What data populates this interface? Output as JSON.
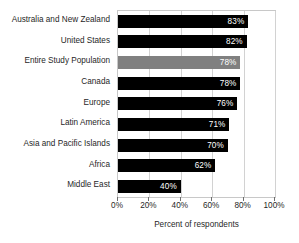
{
  "chart_data": {
    "type": "bar",
    "orientation": "horizontal",
    "title": "",
    "xlabel": "Percent of respondents",
    "ylabel": "",
    "xlim": [
      0,
      100
    ],
    "grid": true,
    "legend": "none",
    "xticks": [
      "0%",
      "20%",
      "40%",
      "60%",
      "80%",
      "100%"
    ],
    "xtick_values": [
      0,
      20,
      40,
      60,
      80,
      100
    ],
    "categories": [
      "Australia and New Zealand",
      "United States",
      "Entire Study Population",
      "Canada",
      "Europe",
      "Latin America",
      "Asia and Pacific Islands",
      "Africa",
      "Middle East"
    ],
    "values": [
      83,
      82,
      78,
      78,
      76,
      71,
      70,
      62,
      40
    ],
    "value_labels": [
      "83%",
      "82%",
      "78%",
      "78%",
      "76%",
      "71%",
      "70%",
      "62%",
      "40%"
    ],
    "bar_colors": [
      "#000000",
      "#000000",
      "#808080",
      "#000000",
      "#000000",
      "#000000",
      "#000000",
      "#000000",
      "#000000"
    ],
    "highlight_category": "Entire Study Population",
    "highlight_color": "#808080",
    "bar_color": "#000000",
    "value_label_color": "#ffffff",
    "axis_color": "#c8c8c8",
    "grid_color": "#d2d2d2"
  }
}
